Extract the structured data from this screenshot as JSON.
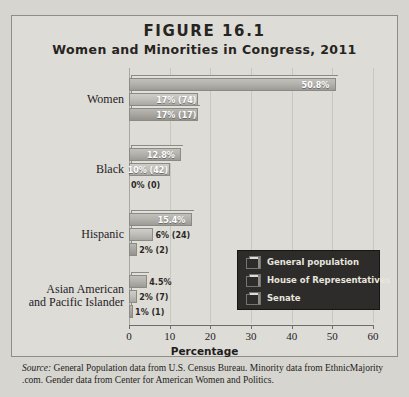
{
  "figure": {
    "number": "FIGURE 16.1",
    "title": "Women and Minorities in Congress, 2011",
    "source_word": "Source:",
    "source_text": " General Population data from U.S. Census Bureau. Minority data from EthnicMajority .com. Gender data from Center for American Women and Politics."
  },
  "legend": {
    "items": [
      {
        "label": "General population"
      },
      {
        "label": "House of Representatives"
      },
      {
        "label": "Senate"
      }
    ]
  },
  "chart_data": {
    "type": "bar",
    "orientation": "horizontal",
    "title": "Women and Minorities in Congress, 2011",
    "xlabel": "Percentage",
    "ylabel": "",
    "xlim": [
      0,
      60
    ],
    "xticks": [
      0,
      10,
      20,
      30,
      40,
      50,
      60
    ],
    "grid": true,
    "legend_position": "inside-right",
    "categories": [
      "Women",
      "Black",
      "Hispanic",
      "Asian American and Pacific Islander"
    ],
    "series": [
      {
        "name": "General population",
        "values": [
          50.8,
          12.8,
          15.4,
          4.5
        ],
        "labels": [
          "50.8%",
          "12.8%",
          "15.4%",
          "4.5%"
        ]
      },
      {
        "name": "House of Representatives",
        "values": [
          17,
          10,
          6,
          2
        ],
        "labels": [
          "17%",
          "10%",
          "6%",
          "2%"
        ],
        "counts": [
          "(74)",
          "(42)",
          "(24)",
          "(7)"
        ]
      },
      {
        "name": "Senate",
        "values": [
          17,
          0,
          2,
          1
        ],
        "labels": [
          "17%",
          "0%",
          "2%",
          "1%"
        ],
        "counts": [
          "(17)",
          "(0)",
          "(2)",
          "(1)"
        ]
      }
    ]
  },
  "axis": {
    "tick_labels": [
      "0",
      "10",
      "20",
      "30",
      "40",
      "50",
      "60"
    ],
    "title": "Percentage"
  },
  "categories_display": [
    {
      "line1": "Women",
      "line2": ""
    },
    {
      "line1": "Black",
      "line2": ""
    },
    {
      "line1": "Hispanic",
      "line2": ""
    },
    {
      "line1": "Asian American",
      "line2": "and Pacific Islander"
    }
  ]
}
